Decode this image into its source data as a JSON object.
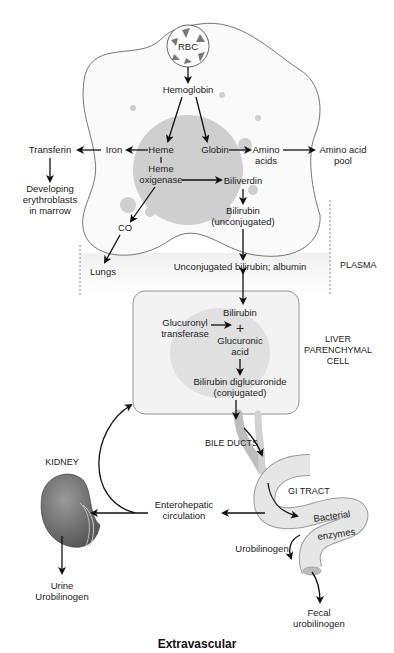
{
  "diagram": {
    "title": "Extravascular",
    "macrophage": {
      "rbc": "RBC",
      "hemoglobin": "Hemoglobin",
      "heme": "Heme",
      "heme_oxigenase_1": "Heme",
      "heme_oxigenase_2": "oxigenase",
      "globin": "Globin",
      "amino_acids_1": "Amino",
      "amino_acids_2": "acids",
      "biliverdin": "Biliverdin",
      "bilirubin_1": "Bilirubin",
      "bilirubin_2": "(unconjugated)",
      "iron": "Iron",
      "co": "CO"
    },
    "outside": {
      "transferin": "Transferin",
      "developing_1": "Developing",
      "developing_2": "erythroblasts",
      "developing_3": "in marrow",
      "amino_pool_1": "Amino acid",
      "amino_pool_2": "pool",
      "lungs": "Lungs"
    },
    "plasma": {
      "label": "PLASMA",
      "content": "Unconjugated bilirubin; albumin"
    },
    "liver": {
      "label_1": "LIVER",
      "label_2": "PARENCHYMAL",
      "label_3": "CELL",
      "bilirubin": "Bilirubin",
      "plus": "+",
      "glucuronyl_1": "Glucuronyl",
      "glucuronyl_2": "transferase",
      "glucuronic_1": "Glucuronic",
      "glucuronic_2": "acid",
      "diglucuronide_1": "Bilirubin diglucuronide",
      "diglucuronide_2": "(conjugated)"
    },
    "gut": {
      "bile_ducts": "BILE DUCTS",
      "gi_tract": "GI TRACT",
      "bacterial": "Bacterial",
      "enzymes": "enzymes",
      "urobilinogen": "Urobilinogen",
      "fecal_1": "Fecal",
      "fecal_2": "urobilinogen",
      "enterohepatic_1": "Enterohepatic",
      "enterohepatic_2": "circulation"
    },
    "kidney": {
      "label": "KIDNEY",
      "urine_1": "Urine",
      "urine_2": "Urobilinogen"
    }
  }
}
